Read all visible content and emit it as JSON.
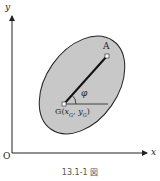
{
  "figure": {
    "caption": "13.1-1 図",
    "axes": {
      "x_label": "x",
      "y_label": "y",
      "origin_label": "O"
    },
    "points": {
      "A": {
        "label": "A"
      },
      "G": {
        "label": "G(x",
        "sub1": "G",
        "mid": ", y",
        "sub2": "G",
        "end": ")"
      }
    },
    "angle_label": "φ",
    "colors": {
      "body_fill": "#c8c8c8",
      "outline": "#222222",
      "axis": "#222222",
      "point_fill": "#ffffff"
    }
  }
}
